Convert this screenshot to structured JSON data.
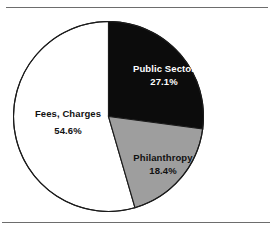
{
  "chart_data": {
    "type": "pie",
    "title": "",
    "subtitle": "",
    "xlabel": "",
    "ylabel": "",
    "legend_position": "none",
    "labels_inside_slices": true,
    "start_angle_deg": 0,
    "direction": "clockwise",
    "categories": [
      "Public Sector",
      "Philanthropy",
      "Fees, Charges"
    ],
    "values": [
      27.1,
      18.4,
      54.6
    ],
    "value_suffix": "%",
    "slices": [
      {
        "label": "Public Sector",
        "value": 27.1,
        "value_text": "27.1%",
        "color": "#0c0c0c",
        "text_color": "#ffffff",
        "start_angle_deg": 0,
        "end_angle_deg": 97.6
      },
      {
        "label": "Philanthropy",
        "value": 18.4,
        "value_text": "18.4%",
        "color": "#9e9e9e",
        "text_color": "#111111",
        "start_angle_deg": 97.6,
        "end_angle_deg": 163.8
      },
      {
        "label": "Fees, Charges",
        "value": 54.6,
        "value_text": "54.6%",
        "color": "#ffffff",
        "text_color": "#111111",
        "start_angle_deg": 163.8,
        "end_angle_deg": 360.0
      }
    ]
  },
  "figure": {
    "outline_color": "#1b1b1b",
    "rule_color": "#6d6d6d",
    "background": "#ffffff"
  }
}
